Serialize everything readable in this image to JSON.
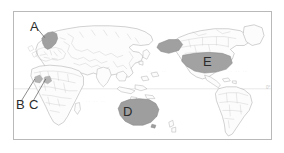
{
  "figure": {
    "type": "world-map",
    "background_color": "#ffffff",
    "frame_border_color": "#b9b9b9",
    "coastline_color": "#9a9a9a",
    "country_border_color": "#c4c4c4",
    "shaded_region_color": "#9e9e9e",
    "label_color": "#2b2b2b"
  },
  "labels": [
    {
      "id": "A",
      "text": "A",
      "target": "scandinavia-norway",
      "x": 30,
      "y": 20
    },
    {
      "id": "B",
      "text": "B",
      "target": "west-africa-coast",
      "x": 16,
      "y": 98
    },
    {
      "id": "C",
      "text": "C",
      "target": "west-africa-inland",
      "x": 29,
      "y": 98
    },
    {
      "id": "D",
      "text": "D",
      "target": "australia",
      "x": 123,
      "y": 105
    },
    {
      "id": "E",
      "text": "E",
      "target": "united-states",
      "x": 203,
      "y": 55
    }
  ],
  "shaded_regions": [
    {
      "name": "scandinavia",
      "label": "A"
    },
    {
      "name": "australia",
      "label": "D"
    },
    {
      "name": "united-states",
      "label": "E"
    },
    {
      "name": "alaska",
      "label": ""
    }
  ],
  "leader_lines": [
    {
      "from": "A",
      "to": "scandinavia"
    },
    {
      "from": "B",
      "to": "west-africa-coast"
    },
    {
      "from": "C",
      "to": "west-africa-inland"
    }
  ],
  "gridlines": {
    "equator_visible": true,
    "equator_color": "#dadada"
  },
  "ocean_microtext": [
    {
      "text": "·· ·· ··",
      "x": 85,
      "y": 100
    },
    {
      "text": "·· ·· ··",
      "x": 148,
      "y": 69
    },
    {
      "text": "·· ·· ··",
      "x": 228,
      "y": 69
    }
  ],
  "edge_marks": [
    {
      "text": "0°",
      "x": 266,
      "y": 86
    }
  ]
}
